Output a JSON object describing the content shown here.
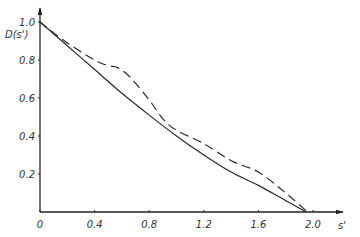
{
  "chart_data": {
    "type": "line",
    "title": "",
    "xlabel": "s'",
    "ylabel": "D(s')",
    "xlim": [
      0,
      2.0
    ],
    "ylim": [
      0,
      1.0
    ],
    "x_ticks": [
      "0",
      "0.4",
      "0.8",
      "1.2",
      "1.6",
      "2.0"
    ],
    "x_tick_values": [
      0,
      0.4,
      0.8,
      1.2,
      1.6,
      2.0
    ],
    "y_ticks": [
      "0.2",
      "0.4",
      "0.6",
      "0.8",
      "1.0"
    ],
    "y_tick_values": [
      0.2,
      0.4,
      0.6,
      0.8,
      1.0
    ],
    "grid": false,
    "legend": null,
    "series": [
      {
        "name": "solid",
        "style": "solid",
        "x": [
          0,
          0.2,
          0.4,
          0.6,
          0.8,
          1.0,
          1.2,
          1.4,
          1.6,
          1.8,
          1.95
        ],
        "y": [
          1.0,
          0.875,
          0.75,
          0.625,
          0.51,
          0.4,
          0.3,
          0.21,
          0.14,
          0.06,
          0.0
        ]
      },
      {
        "name": "dashed",
        "style": "dashed",
        "x": [
          0,
          0.2,
          0.4,
          0.5,
          0.57,
          0.66,
          0.8,
          0.9,
          1.0,
          1.2,
          1.4,
          1.6,
          1.8,
          1.96
        ],
        "y": [
          1.0,
          0.89,
          0.8,
          0.77,
          0.76,
          0.71,
          0.59,
          0.49,
          0.43,
          0.36,
          0.27,
          0.21,
          0.1,
          0.0
        ]
      }
    ]
  }
}
